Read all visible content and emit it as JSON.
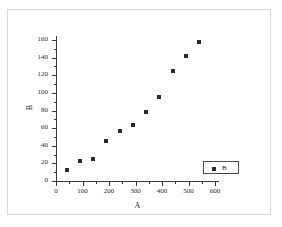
{
  "chart_data": {
    "type": "scatter",
    "title": "",
    "xlabel": "A",
    "ylabel": "B",
    "xlim": [
      0,
      600
    ],
    "ylim": [
      0,
      160
    ],
    "grid": false,
    "legend_position": "bottom-right",
    "legend": [
      "B"
    ],
    "marker": "square",
    "marker_color": "#2a2a2a",
    "xticks": [
      0,
      100,
      200,
      300,
      400,
      500,
      600
    ],
    "yticks": [
      0,
      20,
      40,
      60,
      80,
      100,
      120,
      140,
      160
    ],
    "xtick_labels": [
      "0",
      "100",
      "200",
      "300",
      "400",
      "500",
      "600"
    ],
    "ytick_labels": [
      "0",
      "20",
      "40",
      "60",
      "80",
      "100",
      "120",
      "140",
      "160"
    ],
    "series": [
      {
        "name": "B",
        "x": [
          40,
          90,
          140,
          190,
          240,
          290,
          340,
          390,
          440,
          490,
          540
        ],
        "y": [
          12,
          22.5,
          25,
          45,
          57,
          64,
          78.5,
          95,
          125,
          142,
          158
        ]
      }
    ]
  },
  "axes": {
    "x_title": "A",
    "y_title": "B"
  },
  "legend": {
    "label": "B"
  }
}
